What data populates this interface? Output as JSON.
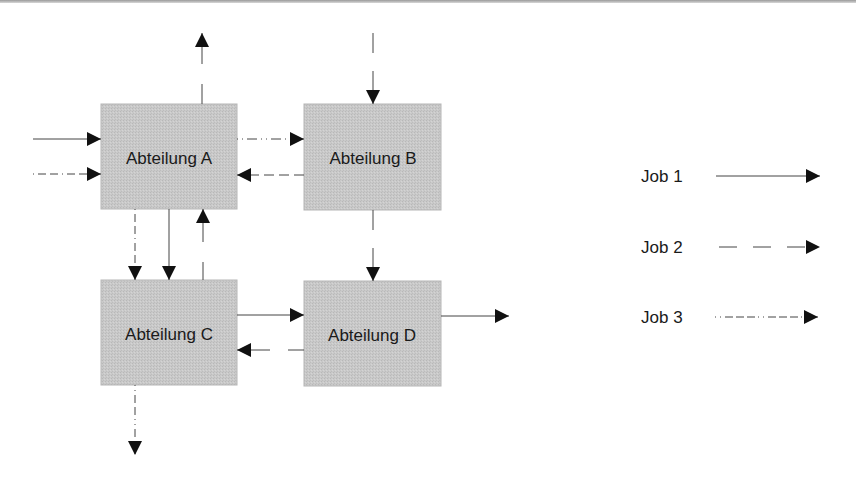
{
  "diagram": {
    "colors": {
      "box_fill": "#c8c8c8",
      "box_stroke": "#b0b0b0",
      "line": "#333333",
      "arrowhead": "#111111",
      "text": "#1a1a1a"
    },
    "boxes": [
      {
        "id": "A",
        "label": "Abteilung A"
      },
      {
        "id": "B",
        "label": "Abteilung B"
      },
      {
        "id": "C",
        "label": "Abteilung C"
      },
      {
        "id": "D",
        "label": "Abteilung D"
      }
    ],
    "legend": [
      {
        "label": "Job 1",
        "style": "solid"
      },
      {
        "label": "Job 2",
        "style": "dashed"
      },
      {
        "label": "Job 3",
        "style": "dash-dot"
      }
    ],
    "flows": [
      {
        "job": "Job 1",
        "from": "external-left",
        "to": "A"
      },
      {
        "job": "Job 3",
        "from": "external-left",
        "to": "A"
      },
      {
        "job": "Job 3",
        "from": "A",
        "to": "B"
      },
      {
        "job": "Job 2",
        "from": "B",
        "to": "A"
      },
      {
        "job": "Job 2",
        "from": "A",
        "to": "external-top"
      },
      {
        "job": "Job 2",
        "from": "external-top",
        "to": "B"
      },
      {
        "job": "Job 3",
        "from": "A",
        "to": "C"
      },
      {
        "job": "Job 1",
        "from": "A",
        "to": "C"
      },
      {
        "job": "Job 2",
        "from": "C",
        "to": "A"
      },
      {
        "job": "Job 2",
        "from": "B",
        "to": "D"
      },
      {
        "job": "Job 1",
        "from": "C",
        "to": "D"
      },
      {
        "job": "Job 2",
        "from": "D",
        "to": "C"
      },
      {
        "job": "Job 1",
        "from": "D",
        "to": "external-right"
      },
      {
        "job": "Job 3",
        "from": "C",
        "to": "external-bottom"
      }
    ]
  }
}
